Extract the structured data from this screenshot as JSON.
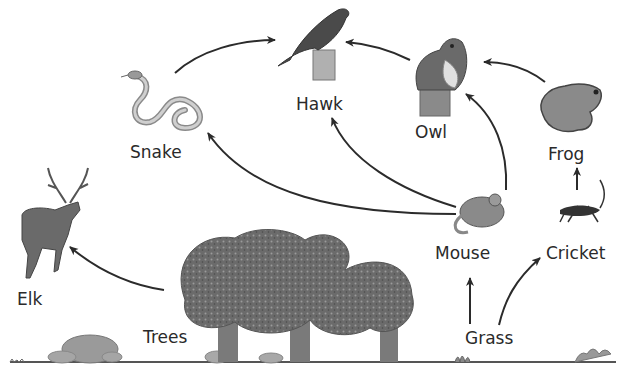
{
  "diagram": {
    "type": "food-web",
    "organisms": [
      {
        "id": "hawk",
        "label": "Hawk"
      },
      {
        "id": "owl",
        "label": "Owl"
      },
      {
        "id": "frog",
        "label": "Frog"
      },
      {
        "id": "snake",
        "label": "Snake"
      },
      {
        "id": "mouse",
        "label": "Mouse"
      },
      {
        "id": "cricket",
        "label": "Cricket"
      },
      {
        "id": "elk",
        "label": "Elk"
      },
      {
        "id": "trees",
        "label": "Trees"
      },
      {
        "id": "grass",
        "label": "Grass"
      }
    ],
    "arrows": [
      {
        "from": "Snake",
        "to": "Hawk"
      },
      {
        "from": "Owl",
        "to": "Hawk"
      },
      {
        "from": "Frog",
        "to": "Owl"
      },
      {
        "from": "Mouse",
        "to": "Snake"
      },
      {
        "from": "Mouse",
        "to": "Hawk"
      },
      {
        "from": "Mouse",
        "to": "Owl"
      },
      {
        "from": "Cricket",
        "to": "Frog"
      },
      {
        "from": "Grass",
        "to": "Mouse"
      },
      {
        "from": "Grass",
        "to": "Cricket"
      },
      {
        "from": "Trees",
        "to": "Elk"
      }
    ],
    "colors": {
      "arrow": "#2b2b2b",
      "text": "#2a2a2a",
      "foliage": "#6e6e6e",
      "ground": "#555555"
    }
  },
  "labels": {
    "hawk": "Hawk",
    "owl": "Owl",
    "frog": "Frog",
    "snake": "Snake",
    "mouse": "Mouse",
    "cricket": "Cricket",
    "elk": "Elk",
    "trees": "Trees",
    "grass": "Grass"
  }
}
